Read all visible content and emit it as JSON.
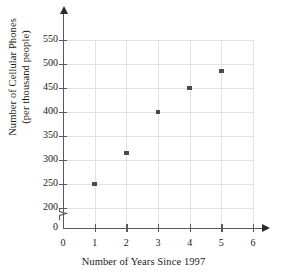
{
  "chart_data": {
    "type": "scatter",
    "title": "",
    "xlabel": "Number of Years Since 1997",
    "ylabel_line1": "Number of Cellular Phones",
    "ylabel_line2": "(per thousand people)",
    "ylabel": "Number of Cellular Phones (per thousand people)",
    "x": [
      1,
      2,
      3,
      4,
      5
    ],
    "values": [
      250,
      315,
      400,
      450,
      485
    ],
    "points": [
      {
        "x": 1,
        "y": 250
      },
      {
        "x": 2,
        "y": 315
      },
      {
        "x": 3,
        "y": 400
      },
      {
        "x": 4,
        "y": 450
      },
      {
        "x": 5,
        "y": 485
      }
    ],
    "xlim": [
      0,
      6
    ],
    "ylim": [
      200,
      550
    ],
    "xticks": [
      0,
      1,
      2,
      3,
      4,
      5,
      6
    ],
    "xtick_labels": [
      "0",
      "1",
      "2",
      "3",
      "4",
      "5",
      "6"
    ],
    "yticks": [
      200,
      250,
      300,
      350,
      400,
      450,
      500,
      550
    ],
    "ytick_labels": [
      "200",
      "250",
      "300",
      "350",
      "400",
      "450",
      "500",
      "550"
    ],
    "y_origin_label": "0",
    "y_axis_break": true,
    "grid": true,
    "legend": null,
    "marker_color": "#4a4a4f",
    "grid_color": "#e2e2e6",
    "axis_color": "#5a5a5a"
  }
}
